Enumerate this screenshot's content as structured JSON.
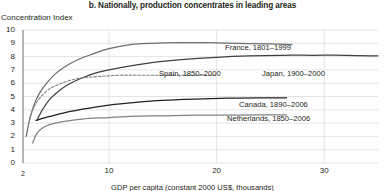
{
  "chart_data": {
    "type": "line",
    "title": "b. Nationally, production concentrates in leading areas",
    "xlabel": "GDP per capita (constant 2000 US$, thousands)",
    "ylabel": "Concentration Index",
    "xlim": [
      2,
      35
    ],
    "ylim": [
      0,
      10
    ],
    "xticks": [
      2,
      10,
      20,
      30
    ],
    "xtick_labels": [
      "2",
      "10",
      "20",
      "30"
    ],
    "yticks": [
      0,
      1,
      2,
      3,
      4,
      5,
      6,
      7,
      8,
      9,
      10
    ],
    "ytick_labels": [
      "0",
      "1",
      "2",
      "3",
      "4",
      "5",
      "6",
      "7",
      "8",
      "9",
      "10"
    ],
    "grid": true,
    "legend_position": "inline-right",
    "series": [
      {
        "name": "France, 1801–1999",
        "color": "#6d6e71",
        "style": "solid",
        "x": [
          2.3,
          2.6,
          3.0,
          3.5,
          4.2,
          5.0,
          6.0,
          7.2,
          8.5,
          10.0,
          12.0,
          14.0,
          16.5,
          19.0,
          22.0,
          25.0,
          27.0
        ],
        "y": [
          2.0,
          3.2,
          4.3,
          5.2,
          6.0,
          6.7,
          7.3,
          7.8,
          8.2,
          8.6,
          8.9,
          9.0,
          9.05,
          9.05,
          9.0,
          8.95,
          8.9
        ]
      },
      {
        "name": "Japan, 1900–2000",
        "color": "#404041",
        "style": "solid",
        "x": [
          3.3,
          3.8,
          4.5,
          5.3,
          6.2,
          7.2,
          8.5,
          10.0,
          12.0,
          14.5,
          17.0,
          20.0,
          23.0,
          26.0,
          29.0,
          32.0,
          35.0
        ],
        "y": [
          3.2,
          4.0,
          4.8,
          5.4,
          5.9,
          6.3,
          6.7,
          7.0,
          7.3,
          7.6,
          7.8,
          7.95,
          8.05,
          8.1,
          8.1,
          8.1,
          8.05
        ]
      },
      {
        "name": "Spain, 1850–2000",
        "color": "#808285",
        "style": "dashed",
        "x": [
          2.6,
          2.9,
          3.3,
          3.8,
          4.5,
          5.3,
          6.3,
          7.5,
          9.0,
          11.0,
          13.0,
          15.0,
          17.5,
          20.0
        ],
        "y": [
          3.3,
          4.0,
          4.6,
          5.1,
          5.6,
          5.9,
          6.2,
          6.4,
          6.5,
          6.6,
          6.6,
          6.6,
          6.6,
          6.6
        ]
      },
      {
        "name": "Canada, 1890–2006",
        "color": "#231f20",
        "style": "solid",
        "x": [
          3.2,
          4.5,
          6.0,
          8.0,
          10.0,
          12.5,
          15.0,
          18.0,
          21.0,
          24.0,
          26.5
        ],
        "y": [
          3.2,
          3.5,
          3.8,
          4.1,
          4.35,
          4.55,
          4.7,
          4.8,
          4.87,
          4.9,
          4.9
        ]
      },
      {
        "name": "Netherlands, 1850–2006",
        "color": "#808285",
        "style": "solid",
        "x": [
          2.9,
          3.2,
          3.6,
          4.2,
          5.0,
          6.0,
          7.5,
          9.5,
          12.0,
          15.0,
          18.0,
          21.0,
          24.0,
          26.5
        ],
        "y": [
          1.5,
          2.1,
          2.5,
          2.8,
          3.0,
          3.15,
          3.3,
          3.4,
          3.5,
          3.55,
          3.6,
          3.6,
          3.62,
          3.62
        ]
      }
    ],
    "series_labels": [
      {
        "text": "France, 1801–1999",
        "x": 225,
        "y": 43
      },
      {
        "text": "Japan, 1900–2000",
        "x": 262,
        "y": 69
      },
      {
        "text": "Spain, 1850–2000",
        "x": 159,
        "y": 69
      },
      {
        "text": "Canada, 1890–2006",
        "x": 239,
        "y": 100
      },
      {
        "text": "Netherlands, 1850–2006",
        "x": 227,
        "y": 114
      }
    ]
  }
}
